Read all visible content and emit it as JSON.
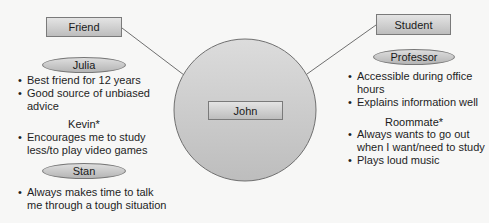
{
  "center": {
    "name": "John"
  },
  "left": {
    "category": "Friend",
    "people": [
      {
        "name": "Julia",
        "style": "oval",
        "notes": [
          "Best friend for 12 years",
          "Good source of unbiased advice"
        ]
      },
      {
        "name": "Kevin*",
        "style": "plain",
        "notes": [
          "Encourages me to study less/to play video games"
        ]
      },
      {
        "name": "Stan",
        "style": "oval",
        "notes": [
          "Always makes time to talk me through a tough situation"
        ]
      }
    ]
  },
  "right": {
    "category": "Student",
    "people": [
      {
        "name": "Professor",
        "style": "oval",
        "notes": [
          "Accessible during office hours",
          "Explains information well"
        ]
      },
      {
        "name": "Roommate*",
        "style": "plain",
        "notes": [
          "Always wants to go out when I want/need to study",
          "Plays loud music"
        ]
      }
    ]
  },
  "colors": {
    "background": "#f7f7f6",
    "shape_fill_light": "#e0e0e0",
    "shape_fill_dark": "#b8b8b8",
    "stroke": "#6f6f6f"
  }
}
